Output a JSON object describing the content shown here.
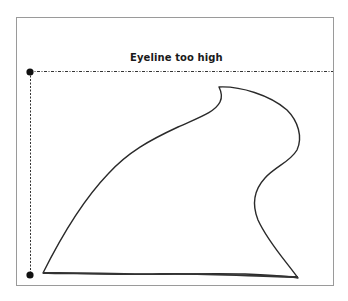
{
  "diagram": {
    "label": "Eyeline too high",
    "colors": {
      "frame": "#9a9a9a",
      "stroke": "#2a2a2a",
      "guide": "#333333",
      "dot": "#111111",
      "background": "#ffffff"
    }
  }
}
